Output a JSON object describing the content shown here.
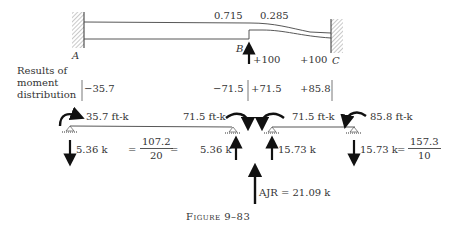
{
  "beam": {
    "support_labels": {
      "A": "A",
      "B": "B",
      "C": "C"
    },
    "distribution_factors": {
      "left_of_B": "0.715",
      "right_of_B": "0.285"
    },
    "fixed_end_moments": {
      "B": "+100",
      "C": "+100"
    }
  },
  "results": {
    "label_line1": "Results of",
    "label_line2": "moment",
    "label_line3": "distribution",
    "values": {
      "A": "−35.7",
      "B_left": "−71.5",
      "B_right": "+71.5",
      "C": "+85.8"
    }
  },
  "free_body": {
    "span_AB": {
      "moment_left": "35.7 ft-k",
      "moment_right": "71.5 ft-k",
      "reaction_left": "5.36 k",
      "reaction_right": "5.36 k",
      "shear_eq_prefix": "=",
      "shear_numerator": "107.2",
      "shear_denominator": "20",
      "shear_eq_suffix": "="
    },
    "span_BC": {
      "moment_left": "71.5 ft-k",
      "moment_right": "85.8 ft-k",
      "reaction_left": "15.73 k",
      "reaction_right": "15.73 k",
      "shear_eq_prefix": "=",
      "shear_numerator": "157.3",
      "shear_denominator": "10"
    },
    "joint_reaction": "AJR = 21.09 k"
  },
  "caption": "Figure 9–83"
}
